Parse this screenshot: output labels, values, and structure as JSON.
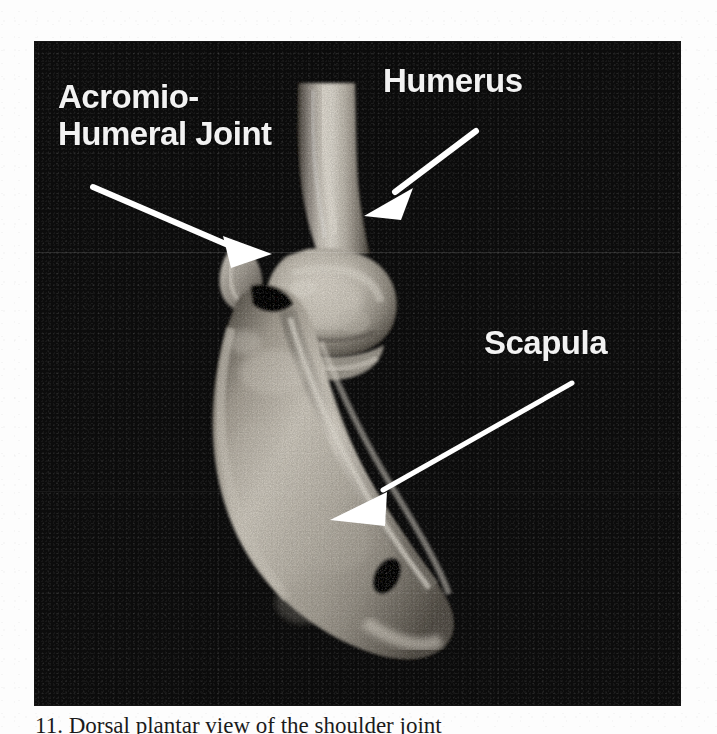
{
  "figure": {
    "modality": "grayscale anatomical bone specimen photograph",
    "panel": {
      "background_color": "#0c0c0c",
      "x": 35,
      "y": 42,
      "width": 645,
      "height": 663
    },
    "bone_colors": {
      "bone_light": "#e6e1d8",
      "bone_mid": "#b9b2a6",
      "bone_shadow": "#6e685e",
      "bone_dark": "#3b372f",
      "label_color": "#f2f2f2",
      "arrow_color": "#ffffff"
    },
    "labels": [
      {
        "id": "acromio-humeral-joint",
        "line1": "Acromio-",
        "line2": "Humeral Joint",
        "text": "Acromio-Humeral Joint"
      },
      {
        "id": "humerus",
        "text": "Humerus"
      },
      {
        "id": "scapula",
        "text": "Scapula"
      }
    ],
    "arrows": [
      {
        "id": "arrow-acromio-humeral-joint",
        "points_to": "Acromio-Humeral Joint",
        "tail": [
          93,
          187
        ],
        "tip": [
          272,
          254
        ]
      },
      {
        "id": "arrow-humerus",
        "points_to": "Humerus",
        "tail": [
          476,
          131
        ],
        "tip": [
          364,
          216
        ]
      },
      {
        "id": "arrow-scapula",
        "points_to": "Scapula",
        "tail": [
          572,
          383
        ],
        "tip": [
          330,
          520
        ]
      }
    ],
    "structures": [
      "humeral shaft",
      "humeral head",
      "acromion",
      "scapular blade",
      "scapular spine"
    ]
  },
  "caption": {
    "text": "11. Dorsal plantar view of the shoulder joint"
  }
}
